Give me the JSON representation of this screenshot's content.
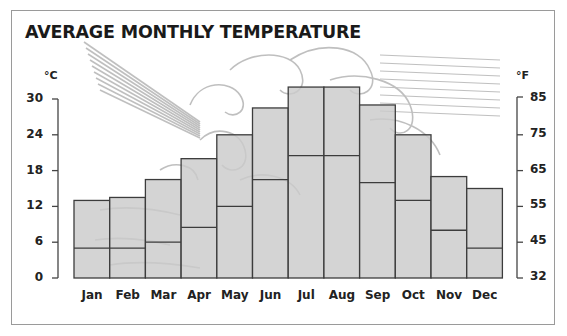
{
  "chart_data": {
    "type": "bar",
    "title": "AVERAGE MONTHLY TEMPERATURE",
    "xlabel": "",
    "ylabel": "°C",
    "ylabel_right": "°F",
    "categories": [
      "Jan",
      "Feb",
      "Mar",
      "Apr",
      "May",
      "Jun",
      "Jul",
      "Aug",
      "Sep",
      "Oct",
      "Nov",
      "Dec"
    ],
    "series": [
      {
        "name": "Average high (°C)",
        "values": [
          13,
          13.5,
          16.5,
          20,
          24,
          28.5,
          32,
          32,
          29,
          24,
          17,
          15
        ]
      },
      {
        "name": "Average low (°C)",
        "values": [
          5,
          5,
          6,
          8.5,
          12,
          16.5,
          20.5,
          20.5,
          16,
          13,
          8,
          5
        ]
      }
    ],
    "ylim": [
      0,
      30
    ],
    "yticks_left": [
      "30",
      "24",
      "18",
      "12",
      "6",
      "0"
    ],
    "yticks_right": [
      "85",
      "75",
      "65",
      "55",
      "45",
      "32"
    ],
    "grid": false,
    "legend": null,
    "bar_fill": "#cbcbcb",
    "bar_stroke": "#3c3c3c",
    "annotation": "Background woodcut illustration of a wind god blowing"
  },
  "labels": {
    "title": "AVERAGE MONTHLY TEMPERATURE",
    "unit_left": "°C",
    "unit_right": "°F"
  }
}
